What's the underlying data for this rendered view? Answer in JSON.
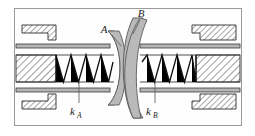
{
  "figure": {
    "frame": {
      "border_color": "#9a9a9a",
      "background": "#fefefe",
      "x": 14,
      "y": 8,
      "width": 228,
      "height": 118
    },
    "labels": {
      "body_a": "A",
      "body_b": "B",
      "spring_a": "k",
      "spring_a_sub": "A",
      "spring_b": "k",
      "spring_b_sub": "B"
    },
    "colors": {
      "lens_fill": "#b9b9b9",
      "lens_stroke": "#4a4a4a",
      "hatch_stroke": "#3a3a3a",
      "rail_fill": "#b5b5b5",
      "rail_stroke": "#3a3a3a",
      "spring_stroke": "#111111",
      "spring_fill": "#000000",
      "leader_stroke": "#555555",
      "text": "#1a1a1a"
    },
    "parts": [
      {
        "name": "upper-left-guide-block",
        "type": "hatched-stepped-block"
      },
      {
        "name": "lower-left-guide-block",
        "type": "hatched-stepped-block"
      },
      {
        "name": "upper-right-guide-block",
        "type": "hatched-stepped-block"
      },
      {
        "name": "lower-right-guide-block",
        "type": "hatched-stepped-block"
      },
      {
        "name": "left-spring-anchor-block",
        "type": "hatched-block"
      },
      {
        "name": "right-spring-anchor-block",
        "type": "hatched-block"
      },
      {
        "name": "upper-rail",
        "type": "double-line-rail"
      },
      {
        "name": "lower-rail",
        "type": "double-line-rail"
      },
      {
        "name": "body-a-lens",
        "type": "curved-disc"
      },
      {
        "name": "body-b-lens",
        "type": "curved-disc"
      },
      {
        "name": "spring-a",
        "type": "zigzag-spring",
        "coils": 4
      },
      {
        "name": "spring-b",
        "type": "zigzag-spring",
        "coils": 4
      }
    ]
  }
}
